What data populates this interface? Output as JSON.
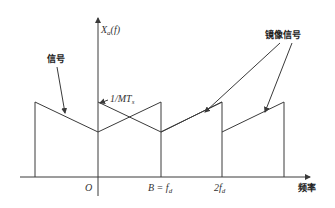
{
  "diagram": {
    "y_axis_label": "Xₐ(f)",
    "y_axis_label_main": "X",
    "y_axis_label_sub": "a",
    "y_axis_label_arg": "(f)",
    "peak_label": "1/MT",
    "peak_label_sub": "s",
    "x_axis_title": "频率",
    "x_ticks": [
      {
        "label": "O"
      },
      {
        "label": "B = f",
        "sub": "d"
      },
      {
        "label": "2f",
        "sub": "d"
      }
    ],
    "annotations": {
      "signal": "信号",
      "image_signal": "镜像信号"
    },
    "colors": {
      "line": "#3a3a3a",
      "text": "#222222",
      "background": "#ffffff"
    }
  }
}
